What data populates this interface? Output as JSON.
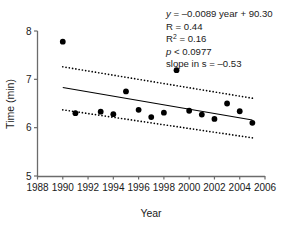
{
  "chart_data": {
    "type": "scatter",
    "title": "",
    "xlabel": "Year",
    "ylabel": "Time (min)",
    "xlim": [
      1988,
      2006
    ],
    "ylim": [
      5,
      8
    ],
    "xticks": [
      1988,
      1990,
      1992,
      1994,
      1996,
      1998,
      2000,
      2002,
      2004,
      2006
    ],
    "yticks": [
      5,
      6,
      7,
      8
    ],
    "grid": false,
    "legend": "none",
    "marker": "filled-circle",
    "marker_color": "#000000",
    "x": [
      1990,
      1991,
      1993,
      1994,
      1995,
      1996,
      1997,
      1998,
      1999,
      2000,
      2001,
      2002,
      2003,
      2004,
      2005
    ],
    "values": [
      7.78,
      6.3,
      6.33,
      6.28,
      6.75,
      6.37,
      6.22,
      6.31,
      7.19,
      6.35,
      6.27,
      6.18,
      6.5,
      6.34,
      6.1
    ],
    "series": [
      {
        "name": "observations",
        "type": "scatter",
        "x": [
          1990,
          1991,
          1993,
          1994,
          1995,
          1996,
          1997,
          1998,
          1999,
          2000,
          2001,
          2002,
          2003,
          2004,
          2005
        ],
        "values": [
          7.78,
          6.3,
          6.33,
          6.28,
          6.75,
          6.37,
          6.22,
          6.31,
          7.19,
          6.35,
          6.27,
          6.18,
          6.5,
          6.34,
          6.1
        ]
      },
      {
        "name": "regression-line",
        "type": "line",
        "style": "solid",
        "x": [
          1990,
          2005
        ],
        "values": [
          6.83,
          6.16
        ]
      },
      {
        "name": "upper-confidence-band",
        "type": "line",
        "style": "dotted",
        "x": [
          1990,
          2005
        ],
        "values": [
          7.26,
          6.61
        ]
      },
      {
        "name": "lower-confidence-band",
        "type": "line",
        "style": "dotted",
        "x": [
          1990,
          2005
        ],
        "values": [
          6.37,
          5.79
        ]
      }
    ],
    "annotations": {
      "equation_y": "y",
      "equation_rest": " = –0.0089 year + 90.30",
      "r": "R = 0.44",
      "r_squared_base": "R",
      "r_squared_sup": "2",
      "r_squared_rest": " = 0.16",
      "p_symbol": "p",
      "p_rest": " < 0.0977",
      "slope": "slope in s = –0.53"
    }
  },
  "axis": {
    "x_label": "Year",
    "y_label": "Time (min)",
    "x_tick_labels": [
      "1988",
      "1990",
      "1992",
      "1994",
      "1996",
      "1998",
      "2000",
      "2002",
      "2004",
      "2006"
    ],
    "y_tick_labels": [
      "5",
      "6",
      "7",
      "8"
    ]
  },
  "colors": {
    "axis": "#6b6b6b",
    "text": "#1a1a1a",
    "marker": "#000000",
    "line": "#000000",
    "background": "#ffffff"
  }
}
